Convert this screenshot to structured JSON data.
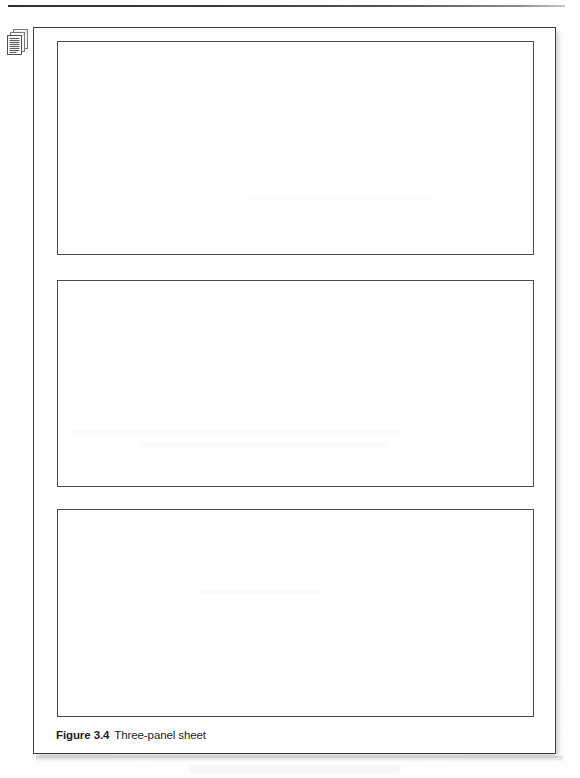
{
  "document": {
    "kind": "scanned-textbook-page",
    "background_color": "#fefefe",
    "page": {
      "border_color": "#3d3d3d",
      "fill_color": "#ffffff"
    }
  },
  "top_rule": {
    "name": "top-horizontal-rule",
    "color": "#2e2e2e"
  },
  "icon": {
    "name": "documents-icon",
    "semantic": "stack-of-pages",
    "sheet_count": 3,
    "line_color": "#6b6b6b",
    "fill_color": "#f2f2f2"
  },
  "panels": [
    {
      "id": "panel-1",
      "label": "",
      "border_color": "#4a4a4a"
    },
    {
      "id": "panel-2",
      "label": "",
      "border_color": "#4a4a4a"
    },
    {
      "id": "panel-3",
      "label": "",
      "border_color": "#4a4a4a"
    }
  ],
  "caption": {
    "label": "Figure 3.4",
    "text": "Three-panel sheet"
  }
}
